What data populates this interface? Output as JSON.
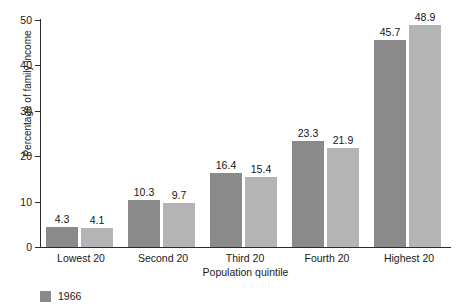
{
  "figure": {
    "clipped_top_caption": "",
    "background_color": "#ffffff"
  },
  "chart_data": {
    "type": "bar",
    "title": "",
    "subtitle": "",
    "xlabel": "Population quintile",
    "ylabel": "Percentage of family income",
    "categories": [
      "Lowest 20",
      "Second 20",
      "Third 20",
      "Fourth 20",
      "Highest 20"
    ],
    "series": [
      {
        "name": "1966",
        "color": "#8a8a8a",
        "values": [
          4.3,
          10.3,
          16.4,
          23.3,
          45.7
        ],
        "labels": [
          "4.3",
          "10.3",
          "16.4",
          "23.3",
          "45.7"
        ]
      },
      {
        "name": "",
        "color": "#b4b4b4",
        "values": [
          4.1,
          9.7,
          15.4,
          21.9,
          48.9
        ],
        "labels": [
          "4.1",
          "9.7",
          "15.4",
          "21.9",
          "48.9"
        ]
      }
    ],
    "ylim": [
      0,
      50
    ],
    "yticks": [
      0,
      10,
      20,
      30,
      40,
      50
    ],
    "ytick_labels": [
      "0",
      "10",
      "20",
      "30",
      "40",
      "50"
    ],
    "grid": false,
    "legend_position": "bottom-left",
    "bar_labels_shown": true
  },
  "legend": {
    "items": [
      {
        "label": "1966",
        "color": "#8a8a8a"
      }
    ]
  },
  "axes": {
    "y_title": "Percentage of family income",
    "x_title": "Population quintile",
    "tick_0": "0",
    "tick_10": "10",
    "tick_20": "20",
    "tick_30": "30",
    "tick_40": "40",
    "tick_50": "50"
  }
}
